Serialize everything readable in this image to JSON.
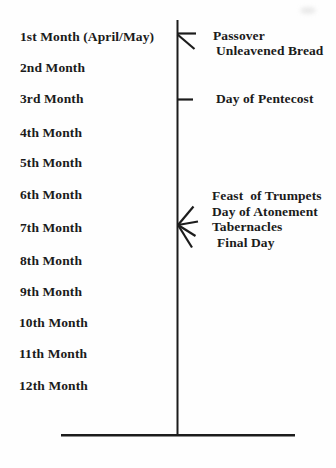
{
  "diagram": {
    "months": [
      {
        "label": "1st Month (April/May)"
      },
      {
        "label": "2nd Month"
      },
      {
        "label": "3rd Month"
      },
      {
        "label": "4th Month"
      },
      {
        "label": "5th Month"
      },
      {
        "label": "6th Month"
      },
      {
        "label": "7th Month"
      },
      {
        "label": "8th Month"
      },
      {
        "label": "9th Month"
      },
      {
        "label": "10th Month"
      },
      {
        "label": "11th Month"
      },
      {
        "label": "12th Month"
      }
    ],
    "event_groups": [
      {
        "marker": "two-line-arrow",
        "attached_to": "1st Month",
        "labels": [
          "Passover",
          "Unleavened Bread"
        ]
      },
      {
        "marker": "tick",
        "attached_to": "3rd Month",
        "labels": [
          "Day of Pentecost"
        ]
      },
      {
        "marker": "four-line-fan",
        "attached_to": "7th Month",
        "labels": [
          "Feast  of Trumpets",
          "Day of Atonement",
          "Tabernacles",
          "Final Day"
        ]
      }
    ],
    "colors": {
      "ink": "#1c1c1c",
      "background": "#fefefe"
    }
  }
}
